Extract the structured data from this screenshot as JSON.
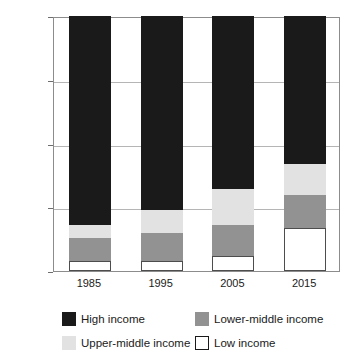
{
  "chart_data": {
    "type": "bar",
    "subtype": "stacked-percentage",
    "title": "",
    "xlabel": "",
    "ylabel": "",
    "categories": [
      "1985",
      "1995",
      "2005",
      "2015"
    ],
    "ylim": [
      0,
      100
    ],
    "y_ticks": [
      "0%",
      "25%",
      "50%",
      "75%",
      "100%"
    ],
    "y_tick_values": [
      0,
      25,
      50,
      75,
      100
    ],
    "grid": true,
    "legend_position": "bottom",
    "stack_order_bottom_to_top": [
      "Low income",
      "Lower-middle income",
      "Upper-middle income",
      "High income"
    ],
    "series": [
      {
        "name": "Low income",
        "color": "#ffffff",
        "values": [
          4,
          4,
          6,
          17
        ]
      },
      {
        "name": "Lower-middle income",
        "color": "#929292",
        "values": [
          9,
          11,
          12,
          13
        ]
      },
      {
        "name": "Upper-middle income",
        "color": "#e2e2e2",
        "values": [
          5,
          9,
          14,
          12
        ]
      },
      {
        "name": "High income",
        "color": "#1a1a1a",
        "values": [
          82,
          76,
          68,
          58
        ]
      }
    ]
  },
  "legend": {
    "items": [
      {
        "label": "High income",
        "swatch": "high"
      },
      {
        "label": "Lower-middle income",
        "swatch": "lower-middle"
      },
      {
        "label": "Upper-middle income",
        "swatch": "upper-middle"
      },
      {
        "label": "Low income",
        "swatch": "low"
      }
    ]
  }
}
